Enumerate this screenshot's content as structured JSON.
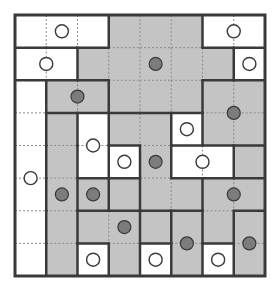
{
  "puzzle": {
    "rows": 8,
    "cols": 8,
    "colors": {
      "white": "#ffffff",
      "gray": "#c4c4c4",
      "thick_line": "#3a3a3a",
      "dotted_line": "#8a8a8a",
      "dark_dot_fill": "#7c7c7c",
      "open_circle_fill": "#ffffff",
      "circle_stroke": "#3a3a3a"
    },
    "cells": [
      [
        "W",
        "W",
        "W",
        "G",
        "G",
        "G",
        "W",
        "W"
      ],
      [
        "W",
        "W",
        "G",
        "G",
        "G",
        "G",
        "G",
        "W"
      ],
      [
        "W",
        "G",
        "G",
        "G",
        "G",
        "G",
        "G",
        "G"
      ],
      [
        "W",
        "G",
        "W",
        "G",
        "G",
        "W",
        "G",
        "G"
      ],
      [
        "W",
        "G",
        "W",
        "W",
        "G",
        "W",
        "W",
        "G"
      ],
      [
        "W",
        "G",
        "G",
        "G",
        "G",
        "G",
        "G",
        "G"
      ],
      [
        "W",
        "G",
        "G",
        "G",
        "G",
        "G",
        "G",
        "G"
      ],
      [
        "W",
        "G",
        "W",
        "G",
        "W",
        "G",
        "W",
        "G"
      ]
    ],
    "regions": [
      [
        "A",
        "A",
        "A",
        "B",
        "B",
        "B",
        "C",
        "C"
      ],
      [
        "D",
        "D",
        "B",
        "B",
        "B",
        "B",
        "B",
        "E"
      ],
      [
        "F",
        "G",
        "G",
        "B",
        "B",
        "B",
        "H",
        "H"
      ],
      [
        "F",
        "I",
        "J",
        "K",
        "K",
        "L",
        "H",
        "H"
      ],
      [
        "F",
        "I",
        "J",
        "M",
        "K",
        "N",
        "N",
        "O"
      ],
      [
        "F",
        "I",
        "P",
        "Q",
        "K",
        "K",
        "R",
        "R"
      ],
      [
        "F",
        "I",
        "S",
        "S",
        "T",
        "U",
        "R",
        "V"
      ],
      [
        "F",
        "I",
        "W",
        "S",
        "X",
        "U",
        "Y",
        "V"
      ]
    ],
    "open_circles": [
      {
        "x": 1.5,
        "y": 0.5
      },
      {
        "x": 7.0,
        "y": 0.5
      },
      {
        "x": 1.0,
        "y": 1.5
      },
      {
        "x": 7.5,
        "y": 1.5
      },
      {
        "x": 2.5,
        "y": 4.0
      },
      {
        "x": 5.5,
        "y": 3.5
      },
      {
        "x": 3.5,
        "y": 4.5
      },
      {
        "x": 6.0,
        "y": 4.5
      },
      {
        "x": 0.5,
        "y": 5.0
      },
      {
        "x": 2.5,
        "y": 7.5
      },
      {
        "x": 4.5,
        "y": 7.5
      },
      {
        "x": 6.5,
        "y": 7.5
      }
    ],
    "filled_circles": [
      {
        "x": 4.5,
        "y": 1.5
      },
      {
        "x": 2.0,
        "y": 2.5
      },
      {
        "x": 7.0,
        "y": 3.0
      },
      {
        "x": 4.5,
        "y": 4.5
      },
      {
        "x": 1.5,
        "y": 5.5
      },
      {
        "x": 2.5,
        "y": 5.5
      },
      {
        "x": 7.0,
        "y": 5.5
      },
      {
        "x": 3.5,
        "y": 6.5
      },
      {
        "x": 5.5,
        "y": 7.0
      },
      {
        "x": 7.5,
        "y": 7.0
      }
    ]
  }
}
